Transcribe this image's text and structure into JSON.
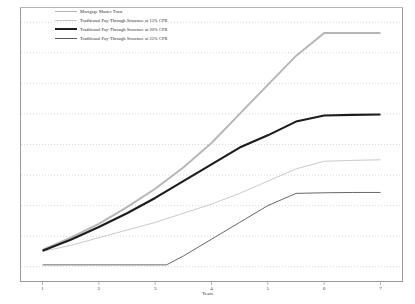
{
  "chart_data": {
    "type": "line",
    "title": "",
    "xlabel": "Years",
    "ylabel": "",
    "xlim": [
      0.6,
      7.4
    ],
    "ylim": [
      0,
      9
    ],
    "grid": true,
    "grid_orientation": "horizontal",
    "grid_style": "dotted",
    "legend_position": "top-left",
    "x_ticks": [
      "1",
      "2",
      "3",
      "4",
      "5",
      "6",
      "7"
    ],
    "x_tick_values": [
      1,
      2,
      3,
      4,
      5,
      6,
      7
    ],
    "y_ticks": [],
    "series": [
      {
        "name": "Mortgage Master Trust",
        "color": "#b6b6b6",
        "width": 1.9,
        "x": [
          1,
          1.5,
          2,
          2.5,
          3,
          3.5,
          4,
          4.5,
          5,
          5.5,
          6,
          6.5,
          7
        ],
        "values": [
          1.05,
          1.45,
          1.9,
          2.45,
          3.05,
          3.75,
          4.55,
          5.5,
          6.45,
          7.4,
          8.15,
          8.15,
          8.15
        ]
      },
      {
        "name": "Traditional Pay-Through Structure at 15% CPR",
        "color": "#c4c4c4",
        "width": 0.9,
        "x": [
          1,
          1.5,
          2,
          2.5,
          3,
          3.5,
          4,
          4.5,
          5,
          5.5,
          6,
          6.5,
          7
        ],
        "values": [
          1.0,
          1.2,
          1.45,
          1.7,
          1.95,
          2.25,
          2.55,
          2.9,
          3.3,
          3.7,
          3.95,
          3.98,
          4.0
        ]
      },
      {
        "name": "Traditional Pay-Through Structure at 20% CPR",
        "color": "#1c1c1c",
        "width": 2.1,
        "x": [
          1,
          1.5,
          2,
          2.5,
          3,
          3.5,
          4,
          4.5,
          5,
          5.5,
          6,
          6.5,
          7
        ],
        "values": [
          1.02,
          1.38,
          1.8,
          2.25,
          2.75,
          3.3,
          3.85,
          4.4,
          4.8,
          5.25,
          5.45,
          5.47,
          5.48
        ]
      },
      {
        "name": "Traditional Pay-Through Structure at 25% CPR",
        "color": "#575757",
        "width": 0.9,
        "x": [
          1,
          1.5,
          2,
          2.5,
          3,
          3.2,
          3.5,
          4,
          4.5,
          5,
          5.5,
          6,
          6.5,
          7
        ],
        "values": [
          0.56,
          0.56,
          0.56,
          0.56,
          0.56,
          0.56,
          0.85,
          1.4,
          1.95,
          2.5,
          2.9,
          2.92,
          2.93,
          2.93
        ]
      }
    ]
  },
  "legend": {
    "items": [
      {
        "label": "Mortgage Master Trust"
      },
      {
        "label": "Traditional Pay-Through Structure at 15% CPR"
      },
      {
        "label": "Traditional Pay-Through Structure at 20% CPR"
      },
      {
        "label": "Traditional Pay-Through Structure at 25% CPR"
      }
    ]
  },
  "axis": {
    "x_title": "Years"
  },
  "colors": {
    "frame": "#9a9a9a",
    "grid": "#c8c8c8",
    "background": "#ffffff"
  }
}
